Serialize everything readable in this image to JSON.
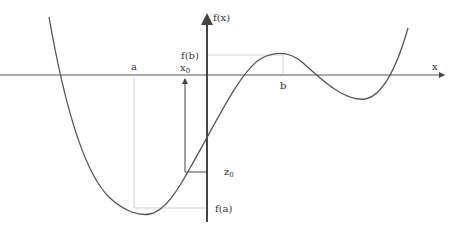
{
  "diagram": {
    "type": "function-plot",
    "colors": {
      "curve": "#555555",
      "axis": "#555555",
      "y_axis": "#444444",
      "guide": "#bbbbbb",
      "label": "#333333"
    },
    "axes": {
      "x_label": "x",
      "y_label": "f(x)"
    },
    "labels": {
      "a": "a",
      "b": "b",
      "fa": "f(a)",
      "fb": "f(b)",
      "x0": "x",
      "x0_sub": "0",
      "z0": "z",
      "z0_sub": "0"
    }
  }
}
